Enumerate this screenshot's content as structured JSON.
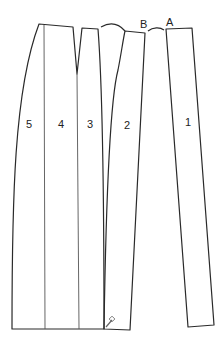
{
  "diagram": {
    "type": "sewing pattern - skirt panels",
    "panels": [
      {
        "id": "panel-5",
        "label": "5"
      },
      {
        "id": "panel-4",
        "label": "4"
      },
      {
        "id": "panel-3",
        "label": "3"
      },
      {
        "id": "panel-2",
        "label": "2"
      },
      {
        "id": "panel-1",
        "label": "1"
      }
    ],
    "points": [
      {
        "id": "point-b",
        "label": "B"
      },
      {
        "id": "point-a",
        "label": "A"
      }
    ],
    "colors": {
      "line": "#2a2a2a",
      "background": "#ffffff"
    }
  }
}
